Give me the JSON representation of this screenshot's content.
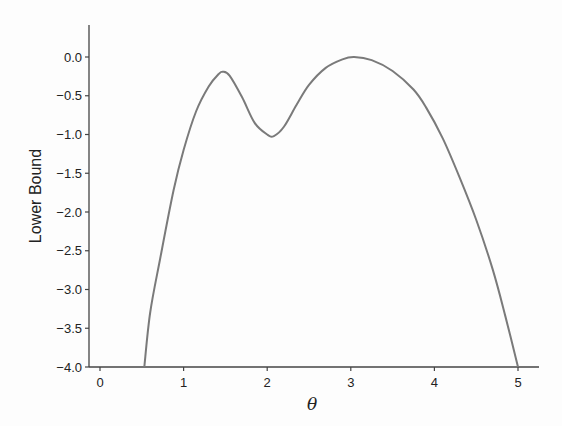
{
  "chart_data": {
    "type": "line",
    "title": "",
    "xlabel": "θ",
    "ylabel": "Lower Bound",
    "xlim": [
      -0.1,
      5.25
    ],
    "ylim": [
      -4.0,
      0.25
    ],
    "xticks": [
      0,
      1,
      2,
      3,
      4,
      5
    ],
    "xtick_labels": [
      "0",
      "1",
      "2",
      "3",
      "4",
      "5"
    ],
    "yticks": [
      0.0,
      -0.5,
      -1.0,
      -1.5,
      -2.0,
      -2.5,
      -3.0,
      -3.5,
      -4.0
    ],
    "ytick_labels": [
      "0.0",
      "−0.5",
      "−1.0",
      "−1.5",
      "−2.0",
      "−2.5",
      "−3.0",
      "−3.5",
      "−4.0"
    ],
    "grid": false,
    "legend": null,
    "line_color": "#7a7a7a",
    "series": [
      {
        "name": "Lower Bound",
        "x": [
          0.53,
          0.6,
          0.72,
          0.88,
          1.0,
          1.15,
          1.3,
          1.42,
          1.47,
          1.55,
          1.7,
          1.85,
          2.0,
          2.08,
          2.2,
          2.35,
          2.5,
          2.7,
          2.9,
          3.04,
          3.25,
          3.5,
          3.75,
          3.9,
          4.1,
          4.3,
          4.5,
          4.7,
          4.85,
          5.0
        ],
        "y": [
          -4.0,
          -3.3,
          -2.6,
          -1.72,
          -1.2,
          -0.7,
          -0.38,
          -0.22,
          -0.19,
          -0.24,
          -0.52,
          -0.85,
          -1.0,
          -1.02,
          -0.9,
          -0.62,
          -0.36,
          -0.14,
          -0.03,
          0.0,
          -0.04,
          -0.18,
          -0.42,
          -0.65,
          -1.05,
          -1.55,
          -2.1,
          -2.75,
          -3.35,
          -4.0
        ]
      }
    ]
  }
}
